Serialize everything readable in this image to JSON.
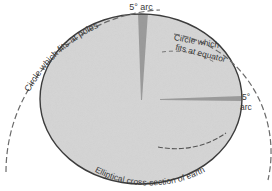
{
  "figure": {
    "labels": {
      "top_arc": "5° arc",
      "right_arc_line1": "5°",
      "right_arc_line2": "arc",
      "pole_circle": "Circle which fits at poles",
      "equator_circle_line1": "Circle which",
      "equator_circle_line2": "fits at equator",
      "ellipse": "Elliptical cross-section of earth"
    },
    "colors": {
      "ellipse_fill": "#d6d6d6",
      "ellipse_stroke": "#3c3c3c",
      "wedge_fill": "#8f8f8f",
      "dashed_circle": "#6a6a6a",
      "text": "#3a3a3a"
    }
  }
}
